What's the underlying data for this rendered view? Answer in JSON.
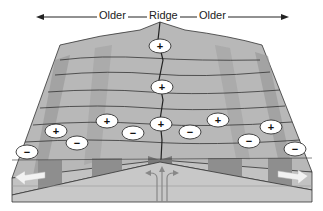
{
  "diagram": {
    "title_labels": {
      "left": "Older",
      "center": "Ridge",
      "right": "Older"
    },
    "polarity_markers": [
      {
        "sign": "+",
        "x": 160,
        "y": 46
      },
      {
        "sign": "+",
        "x": 162,
        "y": 87
      },
      {
        "sign": "+",
        "x": 107,
        "y": 121
      },
      {
        "sign": "+",
        "x": 161,
        "y": 124
      },
      {
        "sign": "+",
        "x": 218,
        "y": 120
      },
      {
        "sign": "+",
        "x": 56,
        "y": 131
      },
      {
        "sign": "+",
        "x": 271,
        "y": 127
      },
      {
        "sign": "−",
        "x": 133,
        "y": 133
      },
      {
        "sign": "−",
        "x": 190,
        "y": 132
      },
      {
        "sign": "−",
        "x": 77,
        "y": 143
      },
      {
        "sign": "−",
        "x": 249,
        "y": 141
      },
      {
        "sign": "−",
        "x": 27,
        "y": 152
      },
      {
        "sign": "−",
        "x": 295,
        "y": 149
      }
    ],
    "colors": {
      "stripe_dark": "#8e8e8e",
      "stripe_light": "#c9c9c9",
      "surface": "#b5b5b5",
      "mantle": "#c4c4c4",
      "marker_fill": "#ffffff",
      "arrow": "#f2f2f2"
    }
  }
}
